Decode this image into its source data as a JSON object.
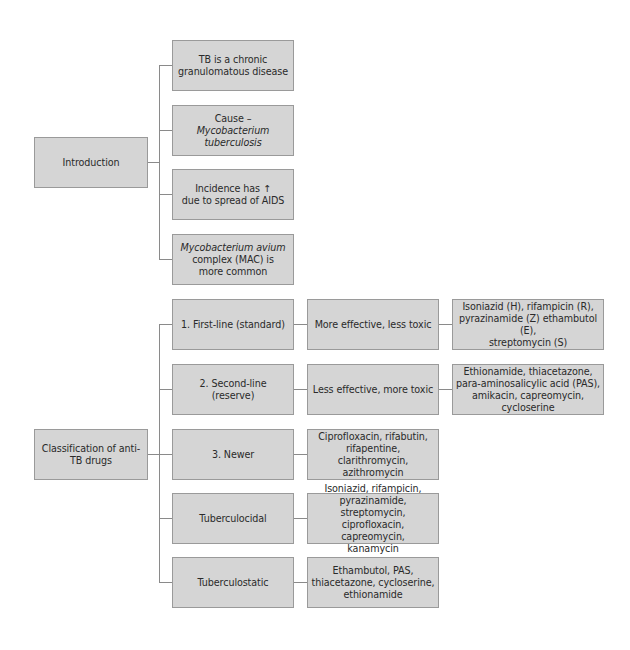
{
  "sections": {
    "introduction": {
      "label": "Introduction",
      "items": [
        {
          "text_plain": "TB is a chronic\ngranulomatous disease"
        },
        {
          "prefix": "Cause – ",
          "italic": "Mycobacterium\ntuberculosis"
        },
        {
          "text_plain": "Incidence has ↑\ndue to spread of AIDS"
        },
        {
          "italic": "Mycobacterium avium",
          "suffix": "complex (MAC) is\nmore common"
        }
      ]
    },
    "classification": {
      "label": "Classification of anti-\nTB drugs",
      "items": [
        {
          "label": "1. First-line (standard)",
          "description": "More effective, less toxic",
          "drugs": "Isoniazid (H), rifampicin (R),\npyrazinamide (Z) ethambutol (E),\nstreptomycin (S)"
        },
        {
          "label": "2. Second-line (reserve)",
          "description": "Less effective, more toxic",
          "drugs": "Ethionamide, thiacetazone,\npara-aminosalicylic acid (PAS),\namikacin, capreomycin,\ncycloserine"
        },
        {
          "label": "3. Newer",
          "drugs": "Ciprofloxacin, rifabutin,\nrifapentine, clarithromycin,\nazithromycin"
        },
        {
          "label": "Tuberculocidal",
          "drugs": "Isoniazid, rifampicin,\npyrazinamide, streptomycin,\nciprofloxacin, capreomycin,\nkanamycin"
        },
        {
          "label": "Tuberculostatic",
          "drugs": "Ethambutol, PAS,\nthiacetazone, cycloserine,\nethionamide"
        }
      ]
    }
  },
  "colors": {
    "box_fill": "#d5d5d5",
    "box_border": "#9a9a9a",
    "connector": "#8a8a8a",
    "text": "#2a2a2a"
  }
}
